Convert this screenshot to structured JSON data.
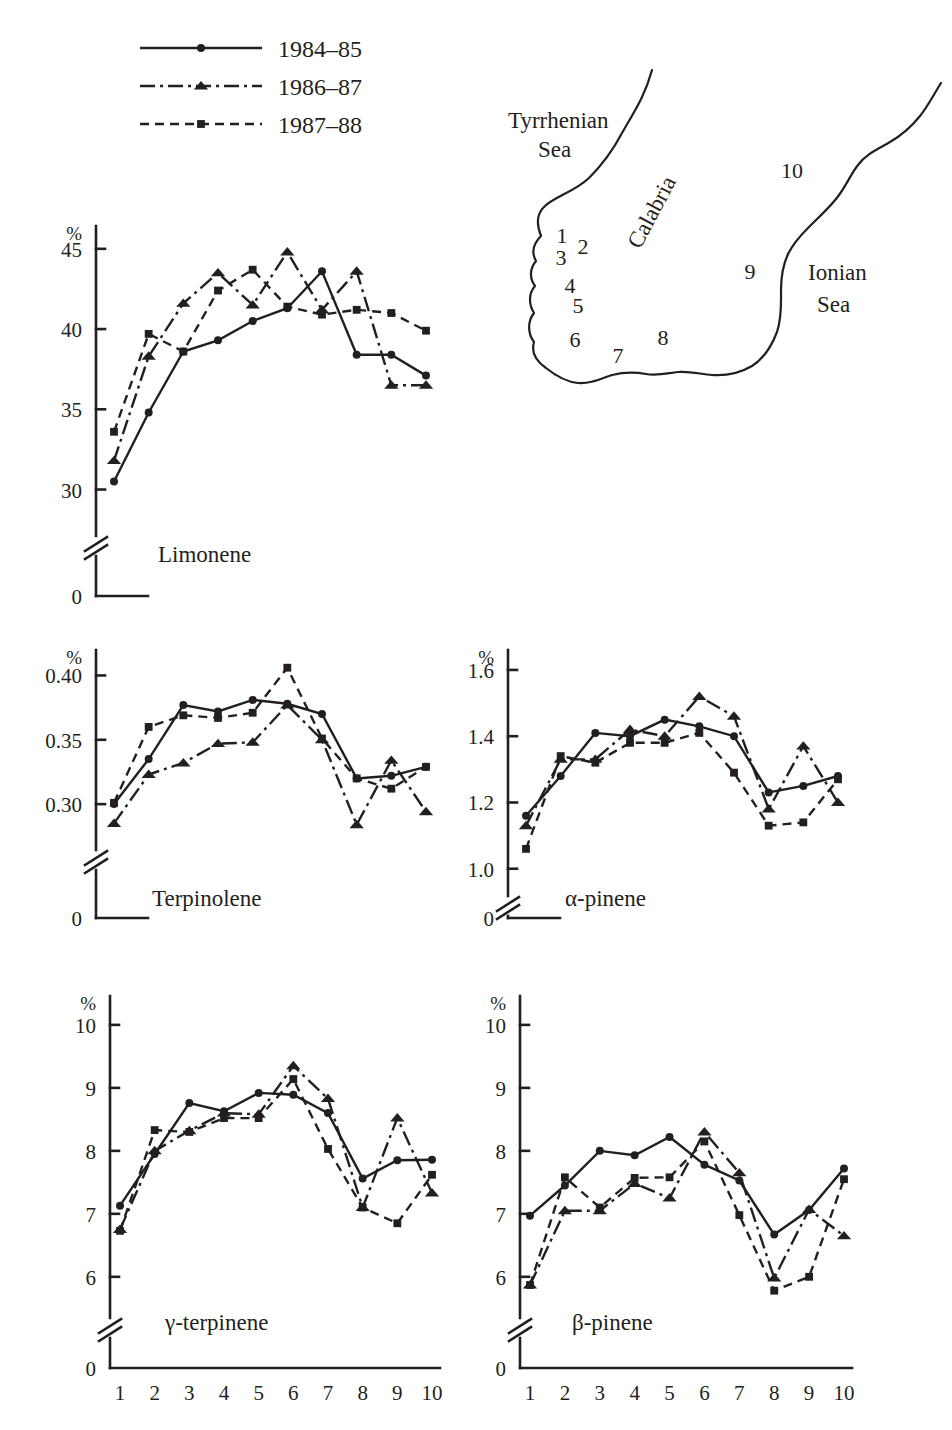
{
  "legend": {
    "items": [
      {
        "label": "1984–85",
        "marker": "circle",
        "dash": "solid"
      },
      {
        "label": "1986–87",
        "marker": "triangle",
        "dash": "dashdot"
      },
      {
        "label": "1987–88",
        "marker": "square",
        "dash": "dashed"
      }
    ]
  },
  "map": {
    "sea_left": "Tyrrhenian\nSea",
    "sea_left_line1": "Tyrrhenian",
    "sea_left_line2": "Sea",
    "sea_right_line1": "Ionian",
    "sea_right_line2": "Sea",
    "region": "Calabria",
    "site_numbers": [
      "1",
      "2",
      "3",
      "4",
      "5",
      "6",
      "7",
      "8",
      "9",
      "10"
    ]
  },
  "axis": {
    "unit": "%",
    "zero": "0",
    "x_categories": [
      "1",
      "2",
      "3",
      "4",
      "5",
      "6",
      "7",
      "8",
      "9",
      "10"
    ]
  },
  "chart_data": [
    {
      "type": "line",
      "title": "Limonene",
      "xlabel": "",
      "ylabel": "%",
      "categories": [
        1,
        2,
        3,
        4,
        5,
        6,
        7,
        8,
        9,
        10
      ],
      "yticks": [
        30,
        35,
        40,
        45
      ],
      "ylim": [
        28.6,
        45.8
      ],
      "axis_break": true,
      "grid": false,
      "legend_position": "top-left-shared",
      "series": [
        {
          "name": "1984–85",
          "marker": "circle",
          "dash": "solid",
          "values": [
            30.5,
            34.8,
            38.6,
            39.3,
            40.5,
            41.3,
            43.6,
            38.4,
            38.4,
            37.1
          ]
        },
        {
          "name": "1986–87",
          "marker": "triangle",
          "dash": "dashdot",
          "values": [
            31.8,
            38.3,
            41.6,
            43.5,
            41.5,
            44.8,
            41.2,
            43.6,
            36.5,
            36.5
          ]
        },
        {
          "name": "1987–88",
          "marker": "square",
          "dash": "dashed",
          "values": [
            33.6,
            39.7,
            38.6,
            42.4,
            43.7,
            41.4,
            40.9,
            41.2,
            41.0,
            39.9
          ]
        }
      ]
    },
    {
      "type": "line",
      "title": "Terpinolene",
      "xlabel": "",
      "ylabel": "%",
      "categories": [
        1,
        2,
        3,
        4,
        5,
        6,
        7,
        8,
        9,
        10
      ],
      "yticks": [
        0.3,
        0.35,
        0.4
      ],
      "ytick_labels": [
        "0.30",
        "0.35",
        "0.40"
      ],
      "ylim": [
        0.283,
        0.412
      ],
      "axis_break": true,
      "grid": false,
      "series": [
        {
          "name": "1984–85",
          "marker": "circle",
          "dash": "solid",
          "values": [
            0.3,
            0.335,
            0.377,
            0.372,
            0.381,
            0.378,
            0.37,
            0.32,
            0.322,
            0.329
          ]
        },
        {
          "name": "1986–87",
          "marker": "triangle",
          "dash": "dashdot",
          "values": [
            0.285,
            0.323,
            0.332,
            0.347,
            0.348,
            0.377,
            0.35,
            0.284,
            0.334,
            0.294
          ]
        },
        {
          "name": "1987–88",
          "marker": "square",
          "dash": "dashed",
          "values": [
            0.301,
            0.36,
            0.369,
            0.367,
            0.371,
            0.406,
            0.351,
            0.32,
            0.312,
            0.329
          ]
        }
      ]
    },
    {
      "type": "line",
      "title": "α-pinene",
      "xlabel": "",
      "ylabel": "%",
      "categories": [
        1,
        2,
        3,
        4,
        5,
        6,
        7,
        8,
        9,
        10
      ],
      "yticks": [
        1.0,
        1.2,
        1.4,
        1.6
      ],
      "ytick_labels": [
        "1.0",
        "1.2",
        "1.4",
        "1.6"
      ],
      "ylim": [
        0.96,
        1.63
      ],
      "axis_break": true,
      "grid": false,
      "series": [
        {
          "name": "1984–85",
          "marker": "circle",
          "dash": "solid",
          "values": [
            1.16,
            1.28,
            1.41,
            1.4,
            1.45,
            1.43,
            1.4,
            1.23,
            1.25,
            1.28
          ]
        },
        {
          "name": "1986–87",
          "marker": "triangle",
          "dash": "dashdot",
          "values": [
            1.13,
            1.33,
            1.33,
            1.42,
            1.4,
            1.52,
            1.46,
            1.18,
            1.37,
            1.2
          ]
        },
        {
          "name": "1987–88",
          "marker": "square",
          "dash": "dashed",
          "values": [
            1.06,
            1.34,
            1.32,
            1.38,
            1.38,
            1.41,
            1.29,
            1.13,
            1.14,
            1.27
          ]
        }
      ]
    },
    {
      "type": "line",
      "title": "γ-terpinene",
      "xlabel": "",
      "ylabel": "%",
      "categories": [
        1,
        2,
        3,
        4,
        5,
        6,
        7,
        8,
        9,
        10
      ],
      "yticks": [
        6,
        7,
        8,
        9,
        10
      ],
      "ylim": [
        5.6,
        10.3
      ],
      "axis_break": true,
      "grid": false,
      "series": [
        {
          "name": "1984–85",
          "marker": "circle",
          "dash": "solid",
          "values": [
            7.13,
            7.95,
            8.76,
            8.63,
            8.92,
            8.89,
            8.6,
            7.56,
            7.85,
            7.86
          ]
        },
        {
          "name": "1986–87",
          "marker": "triangle",
          "dash": "dashdot",
          "values": [
            6.75,
            8.0,
            8.32,
            8.6,
            8.58,
            9.35,
            8.83,
            7.1,
            8.52,
            7.33
          ]
        },
        {
          "name": "1987–88",
          "marker": "square",
          "dash": "dashed",
          "values": [
            6.73,
            8.33,
            8.3,
            8.52,
            8.52,
            9.14,
            8.03,
            7.1,
            6.85,
            7.62
          ]
        }
      ]
    },
    {
      "type": "line",
      "title": "β-pinene",
      "xlabel": "",
      "ylabel": "%",
      "categories": [
        1,
        2,
        3,
        4,
        5,
        6,
        7,
        8,
        9,
        10
      ],
      "yticks": [
        6,
        7,
        8,
        9,
        10
      ],
      "ylim": [
        5.6,
        10.3
      ],
      "axis_break": true,
      "grid": false,
      "series": [
        {
          "name": "1984–85",
          "marker": "circle",
          "dash": "solid",
          "values": [
            6.97,
            7.45,
            8.0,
            7.93,
            8.22,
            7.78,
            7.53,
            6.67,
            7.06,
            7.72
          ]
        },
        {
          "name": "1986–87",
          "marker": "triangle",
          "dash": "dashdot",
          "values": [
            5.87,
            7.05,
            7.05,
            7.48,
            7.25,
            8.3,
            7.65,
            5.98,
            7.07,
            6.65
          ]
        },
        {
          "name": "1987–88",
          "marker": "square",
          "dash": "dashed",
          "values": [
            5.87,
            7.58,
            7.1,
            7.57,
            7.58,
            8.15,
            6.98,
            5.78,
            6.0,
            7.55
          ]
        }
      ]
    }
  ]
}
